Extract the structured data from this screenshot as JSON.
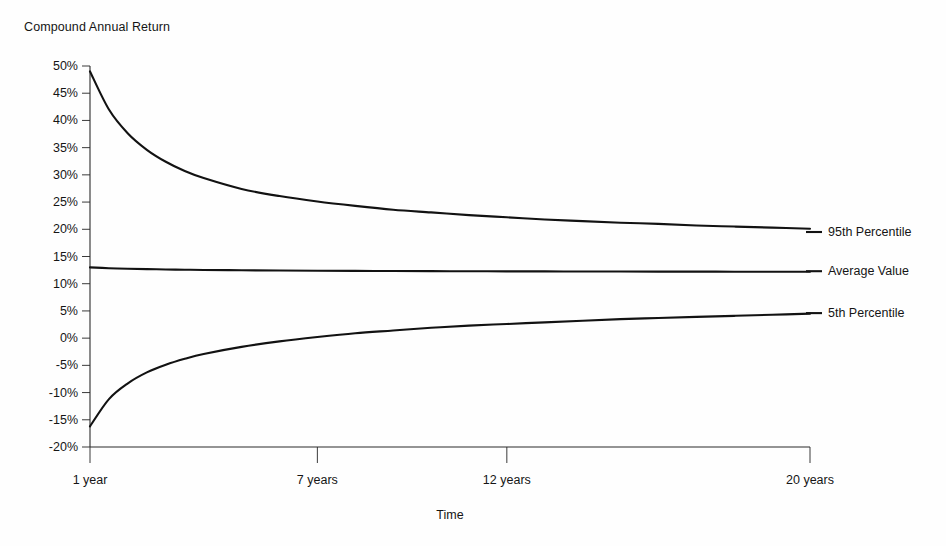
{
  "chart_data": {
    "type": "line",
    "title": "",
    "ylabel": "Compound Annual Return",
    "xlabel": "Time",
    "grid": false,
    "legend_position": "right-inline",
    "ylim": [
      -20,
      50
    ],
    "xlim": [
      1,
      20
    ],
    "ytick_labels": [
      "50%",
      "45%",
      "40%",
      "35%",
      "30%",
      "25%",
      "20%",
      "15%",
      "10%",
      "5%",
      "0%",
      "-5%",
      "-10%",
      "-15%",
      "-20%"
    ],
    "ytick_values": [
      50,
      45,
      40,
      35,
      30,
      25,
      20,
      15,
      10,
      5,
      0,
      -5,
      -10,
      -15,
      -20
    ],
    "xtick_labels": [
      "1 year",
      "7 years",
      "12 years",
      "20 years"
    ],
    "xtick_values": [
      1,
      7,
      12,
      20
    ],
    "x": [
      1,
      1.5,
      2,
      2.5,
      3,
      3.5,
      4,
      5,
      6,
      7,
      8,
      9,
      10,
      11,
      12,
      13,
      14,
      15,
      16,
      17,
      18,
      19,
      20
    ],
    "series": [
      {
        "name": "95th Percentile",
        "label": "95th Percentile",
        "label_y": 19.5,
        "values": [
          49.0,
          42.0,
          37.6,
          34.6,
          32.4,
          30.7,
          29.4,
          27.4,
          26.1,
          25.1,
          24.3,
          23.6,
          23.1,
          22.6,
          22.2,
          21.8,
          21.5,
          21.2,
          21.0,
          20.7,
          20.5,
          20.3,
          20.1
        ]
      },
      {
        "name": "Average Value",
        "label": "Average Value",
        "label_y": 12.3,
        "values": [
          13.0,
          12.85,
          12.75,
          12.68,
          12.62,
          12.57,
          12.53,
          12.47,
          12.42,
          12.38,
          12.35,
          12.33,
          12.31,
          12.29,
          12.27,
          12.26,
          12.25,
          12.24,
          12.23,
          12.22,
          12.21,
          12.2,
          12.2
        ]
      },
      {
        "name": "5th Percentile",
        "label": "5th Percentile",
        "label_y": 4.6,
        "values": [
          -16.2,
          -11.2,
          -8.3,
          -6.3,
          -4.9,
          -3.8,
          -2.9,
          -1.6,
          -0.6,
          0.2,
          0.9,
          1.4,
          1.9,
          2.3,
          2.6,
          2.9,
          3.2,
          3.5,
          3.7,
          3.9,
          4.1,
          4.3,
          4.5
        ]
      }
    ]
  },
  "axis": {
    "y_title": "Compound Annual Return",
    "x_title": "Time"
  }
}
